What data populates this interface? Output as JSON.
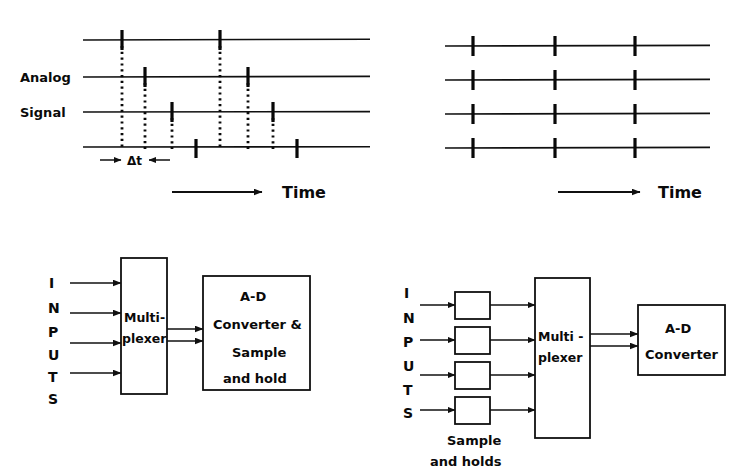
{
  "figure": {
    "background_color": "#ffffff",
    "ink_color": "#0a0a0a"
  },
  "panels": {
    "top_left": {
      "name": "Sequential multiplexer sampling timing",
      "side_labels": [
        "Analog",
        "Signal"
      ],
      "axis_label": "Time",
      "interval_label": "Δt",
      "channel_count": 4,
      "lines_x": [
        83,
        370
      ],
      "lines_y": [
        40,
        77,
        112,
        147
      ],
      "sample_columns_x": [
        122,
        145,
        172,
        196,
        220,
        248,
        273,
        297
      ],
      "marks": [
        {
          "col": 0,
          "channel": 0,
          "dotted_to_channel": 3
        },
        {
          "col": 1,
          "channel": 1,
          "dotted_to_channel": 3
        },
        {
          "col": 2,
          "channel": 2,
          "dotted_to_channel": 3
        },
        {
          "col": 3,
          "channel": 3,
          "dotted_to_channel": 3
        },
        {
          "col": 4,
          "channel": 0,
          "dotted_to_channel": 3
        },
        {
          "col": 5,
          "channel": 1,
          "dotted_to_channel": 3
        },
        {
          "col": 6,
          "channel": 2,
          "dotted_to_channel": 3
        },
        {
          "col": 7,
          "channel": 3,
          "dotted_to_channel": 3
        }
      ],
      "arrow": {
        "x1": 172,
        "x2": 262,
        "y": 192
      },
      "time_label_x": 282,
      "delta_marker": {
        "y": 158,
        "left_arrow_x1": 100,
        "left_arrow_x2": 124,
        "right_arrow_x1": 170,
        "right_arrow_x2": 146,
        "label_x": 134
      }
    },
    "top_right": {
      "name": "Simultaneous sample-and-hold timing",
      "side_labels": [],
      "axis_label": "Time",
      "channel_count": 4,
      "lines_x": [
        445,
        710
      ],
      "lines_y": [
        46,
        80,
        114,
        148
      ],
      "sample_columns_x": [
        473,
        555,
        635
      ],
      "arrow": {
        "x1": 558,
        "x2": 640,
        "y": 192
      },
      "time_label_x": 658
    },
    "bottom_left": {
      "name": "Multiplexer then A-D converter with sample and hold",
      "input_letters": [
        "I",
        "N",
        "P",
        "U",
        "T",
        "S"
      ],
      "input_arrow_count": 4,
      "blocks": [
        {
          "id": "multiplexer",
          "lines": [
            "Multi-",
            "plexer"
          ],
          "x": 121,
          "y": 258,
          "w": 46,
          "h": 136
        },
        {
          "id": "adc",
          "lines": [
            "A-D",
            "Converter &",
            "Sample",
            "and hold"
          ],
          "x": 203,
          "y": 276,
          "w": 107,
          "h": 114
        }
      ],
      "output_bus_lines": 2
    },
    "bottom_right": {
      "name": "Per-channel sample and holds then multiplexer and A-D converter",
      "input_letters": [
        "I",
        "N",
        "P",
        "U",
        "T",
        "S"
      ],
      "input_arrow_count": 4,
      "caption_lines": [
        "Sample",
        "and  holds"
      ],
      "sample_hold_boxes": {
        "count": 4,
        "x": 455,
        "w": 35,
        "h": 27,
        "ys": [
          292,
          327,
          362,
          397
        ]
      },
      "blocks": [
        {
          "id": "multiplexer",
          "lines": [
            "Multi -",
            "plexer"
          ],
          "x": 535,
          "y": 278,
          "w": 55,
          "h": 160
        },
        {
          "id": "adc",
          "lines": [
            "A-D",
            "Converter"
          ],
          "x": 638,
          "y": 305,
          "w": 87,
          "h": 70
        }
      ],
      "output_bus_lines": 2
    }
  }
}
